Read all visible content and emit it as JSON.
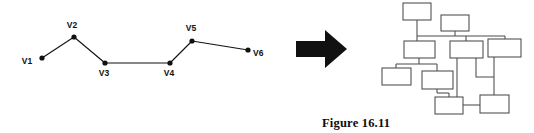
{
  "figure": {
    "caption": "Figure 16.11",
    "background_color": "#ffffff",
    "ink_color": "#111111",
    "box_stroke_color": "#4a4a4a",
    "width": 534,
    "height": 133
  },
  "left_panel": {
    "name": "polyline-vertex-chain",
    "description": "open polyline with six labelled vertices",
    "vertices": [
      {
        "id": "v1",
        "label": "V1",
        "x": 42,
        "y": 58,
        "label_x": 27,
        "label_y": 64
      },
      {
        "id": "v2",
        "label": "V2",
        "x": 74,
        "y": 37,
        "label_x": 66,
        "label_y": 28
      },
      {
        "id": "v3",
        "label": "V3",
        "x": 105,
        "y": 63,
        "label_x": 97,
        "label_y": 76
      },
      {
        "id": "v4",
        "label": "V4",
        "x": 170,
        "y": 63,
        "label_x": 162,
        "label_y": 76
      },
      {
        "id": "v5",
        "label": "V5",
        "x": 192,
        "y": 41,
        "label_x": 184,
        "label_y": 31
      },
      {
        "id": "v6",
        "label": "V6",
        "x": 248,
        "y": 50,
        "label_x": 253,
        "label_y": 56
      }
    ],
    "edges": [
      {
        "from": "v1",
        "to": "v2"
      },
      {
        "from": "v2",
        "to": "v3"
      },
      {
        "from": "v3",
        "to": "v4"
      },
      {
        "from": "v4",
        "to": "v5"
      },
      {
        "from": "v5",
        "to": "v6"
      }
    ],
    "dot_radius": 2.6
  },
  "arrow": {
    "name": "transformation-arrow",
    "direction": "right",
    "points": "296,41 325,41 325,30 347,49 325,68 325,57 296,57",
    "color": "#111111"
  },
  "right_panel": {
    "name": "node-link-network",
    "description": "network of plain rectangles joined by orthogonal connector lines",
    "boxes": [
      {
        "id": "b1",
        "x": 403,
        "y": 3,
        "w": 28,
        "h": 17
      },
      {
        "id": "b2",
        "x": 441,
        "y": 15,
        "w": 28,
        "h": 16
      },
      {
        "id": "b3",
        "x": 404,
        "y": 41,
        "w": 31,
        "h": 17
      },
      {
        "id": "b4",
        "x": 450,
        "y": 41,
        "w": 33,
        "h": 17
      },
      {
        "id": "b5",
        "x": 488,
        "y": 39,
        "w": 33,
        "h": 18
      },
      {
        "id": "b6",
        "x": 382,
        "y": 68,
        "w": 29,
        "h": 17
      },
      {
        "id": "b7",
        "x": 422,
        "y": 71,
        "w": 31,
        "h": 18
      },
      {
        "id": "b8",
        "x": 435,
        "y": 97,
        "w": 28,
        "h": 17
      },
      {
        "id": "b9",
        "x": 480,
        "y": 95,
        "w": 29,
        "h": 18
      }
    ],
    "links": [
      {
        "from": "b1",
        "to": "bus-top",
        "path": "M417,20 L417,36"
      },
      {
        "from": "b2",
        "to": "bus-top",
        "path": "M455,31 L455,36"
      },
      {
        "from": "bus-top",
        "to": "row",
        "path": "M417,36 L505,36"
      },
      {
        "from": "bus-top",
        "to": "b3",
        "path": "M417,36 L417,41"
      },
      {
        "from": "bus-top",
        "to": "b4",
        "path": "M466,36 L466,41"
      },
      {
        "from": "bus-top",
        "to": "b5",
        "path": "M505,36 L505,39"
      },
      {
        "from": "b3",
        "to": "bus-mid",
        "path": "M419,58 L419,64"
      },
      {
        "from": "bus-mid",
        "to": "row",
        "path": "M396,64 L437,64"
      },
      {
        "from": "bus-mid",
        "to": "b6",
        "path": "M396,64 L396,68"
      },
      {
        "from": "bus-mid",
        "to": "b7",
        "path": "M437,64 L437,71"
      },
      {
        "from": "b7",
        "to": "bus-low",
        "path": "M437,89 L437,93"
      },
      {
        "from": "bus-low",
        "to": "row",
        "path": "M437,93 L449,93"
      },
      {
        "from": "bus-low",
        "to": "b8",
        "path": "M449,93 L449,97"
      },
      {
        "from": "b4",
        "to": "bus-low2",
        "path": "M457,58 L457,105"
      },
      {
        "from": "bus-low2",
        "to": "b8",
        "path": "M457,105 L463,105"
      },
      {
        "from": "b4",
        "to": "spur",
        "path": "M476,58 L476,77 L494,77"
      },
      {
        "from": "b5",
        "to": "b9",
        "path": "M494,57 L494,95"
      },
      {
        "from": "b8",
        "to": "b9",
        "path": "M463,105 L480,105"
      }
    ]
  },
  "caption": {
    "text": "Figure 16.11",
    "x": 322,
    "y": 127
  }
}
